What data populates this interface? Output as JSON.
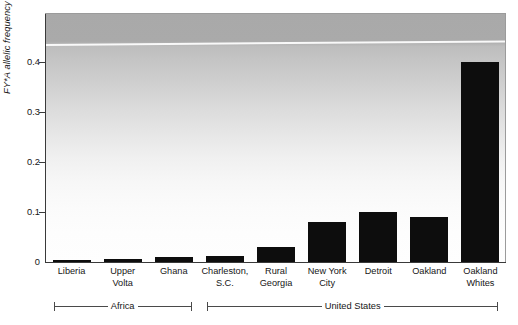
{
  "chart_data": {
    "type": "bar",
    "title": "",
    "subtitle": "",
    "xlabel": "",
    "ylabel": "FY*A allelic frequency",
    "ylim": [
      0,
      0.47
    ],
    "yticks": [
      "0",
      "0.1",
      "0.2",
      "0.3",
      "0.4"
    ],
    "ytick_values": [
      0,
      0.1,
      0.2,
      0.3,
      0.4
    ],
    "grid": false,
    "legend": "none",
    "bar_color": "#0d0d0d",
    "categories": [
      "Liberia",
      "Upper Volta",
      "Ghana",
      "Charleston, S.C.",
      "Rural Georgia",
      "New York City",
      "Detroit",
      "Oakland",
      "Oakland Whites"
    ],
    "values": [
      0.003,
      0.006,
      0.01,
      0.012,
      0.03,
      0.08,
      0.1,
      0.09,
      0.4
    ],
    "groups": [
      {
        "label": "Africa",
        "categories": [
          "Liberia",
          "Upper Volta",
          "Ghana"
        ]
      },
      {
        "label": "United States",
        "categories": [
          "Charleston, S.C.",
          "Rural Georgia",
          "New York City",
          "Detroit",
          "Oakland",
          "Oakland Whites"
        ]
      }
    ]
  },
  "axis": {
    "y_title": "FY*A allelic frequency",
    "y_ticks": [
      {
        "label": "0.4",
        "value": 0.4
      },
      {
        "label": "0.3",
        "value": 0.3
      },
      {
        "label": "0.2",
        "value": 0.2
      },
      {
        "label": "0.1",
        "value": 0.1
      },
      {
        "label": "0",
        "value": 0
      }
    ]
  },
  "bars": [
    {
      "label_line1": "Liberia",
      "label_line2": "",
      "value": 0.003
    },
    {
      "label_line1": "Upper",
      "label_line2": "Volta",
      "value": 0.006
    },
    {
      "label_line1": "Ghana",
      "label_line2": "",
      "value": 0.01
    },
    {
      "label_line1": "Charleston,",
      "label_line2": "S.C.",
      "value": 0.012
    },
    {
      "label_line1": "Rural",
      "label_line2": "Georgia",
      "value": 0.03
    },
    {
      "label_line1": "New York",
      "label_line2": "City",
      "value": 0.08
    },
    {
      "label_line1": "Detroit",
      "label_line2": "",
      "value": 0.1
    },
    {
      "label_line1": "Oakland",
      "label_line2": "",
      "value": 0.09
    },
    {
      "label_line1": "Oakland",
      "label_line2": "Whites",
      "value": 0.4
    }
  ],
  "brackets": [
    {
      "label": "Africa"
    },
    {
      "label": "United States"
    }
  ],
  "colors": {
    "bar": "#0d0d0d",
    "axis": "#3a3a3a",
    "text": "#161616",
    "panel_top": "#a9a9a9",
    "panel_bottom": "#fefefe"
  }
}
